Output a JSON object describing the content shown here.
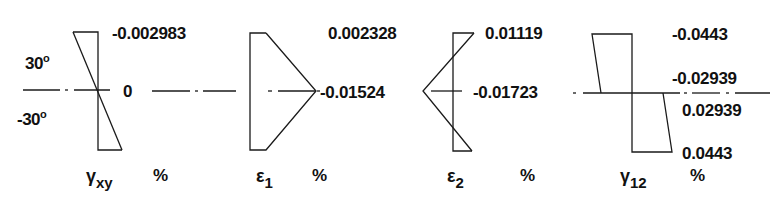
{
  "figure": {
    "ply_angles": {
      "top": "30",
      "bottom": "-30",
      "degree_symbol": "o"
    },
    "line_color": "#1a1a1a",
    "background": "#ffffff"
  },
  "panels": [
    {
      "id": "gamma_xy",
      "symbol": "γ",
      "subscript": "xy",
      "unit": "%",
      "labels": {
        "top": "-0.002983",
        "mid": "0"
      }
    },
    {
      "id": "epsilon_1",
      "symbol": "ε",
      "subscript": "1",
      "unit": "%",
      "labels": {
        "top": "0.002328",
        "mid": "-0.01524"
      }
    },
    {
      "id": "epsilon_2",
      "symbol": "ε",
      "subscript": "2",
      "unit": "%",
      "labels": {
        "top": "0.01119",
        "mid": "-0.01723"
      }
    },
    {
      "id": "gamma_12",
      "symbol": "γ",
      "subscript": "12",
      "unit": "%",
      "labels": {
        "top": "-0.0443",
        "mid_upper": "-0.02939",
        "mid_lower": "0.02939",
        "bottom": "0.0443"
      }
    }
  ]
}
